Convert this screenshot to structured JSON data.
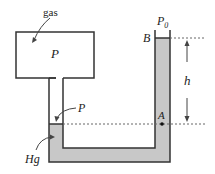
{
  "diagram": {
    "labels": {
      "gas": "gas",
      "container_pressure": "P",
      "interface_pressure": "P",
      "mercury": "Hg",
      "atmospheric_pressure_symbol": "P",
      "atmospheric_pressure_subscript": "0",
      "point_b": "B",
      "point_a": "A",
      "height": "h"
    },
    "colors": {
      "outline": "#333333",
      "mercury_fill": "#c8c8c8",
      "dotted_line": "#666666",
      "background": "#ffffff"
    }
  }
}
